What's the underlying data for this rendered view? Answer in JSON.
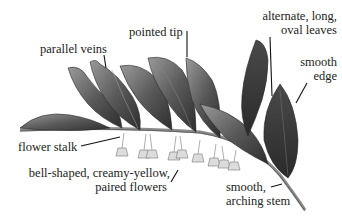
{
  "diagram": {
    "colors": {
      "ink": "#222222",
      "leaf_dark": "#3a3a3a",
      "leaf_mid": "#6a6a6a",
      "leaf_light": "#9a9a9a",
      "flower": "#c8c8c8",
      "stem": "#8a8a8a"
    },
    "labels": {
      "parallel_veins": "parallel veins",
      "pointed_tip": "pointed tip",
      "alternate_leaves_1": "alternate, long,",
      "alternate_leaves_2": "oval leaves",
      "smooth_edge_1": "smooth",
      "smooth_edge_2": "edge",
      "flower_stalk": "flower stalk",
      "bell_flowers_1": "bell-shaped, creamy-yellow,",
      "bell_flowers_2": "paired flowers",
      "smooth_stem_1": "smooth,",
      "smooth_stem_2": "arching stem"
    }
  }
}
